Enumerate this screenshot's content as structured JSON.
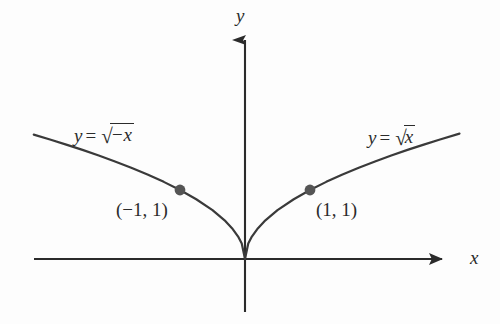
{
  "figure": {
    "background_color": "#fdfdfd",
    "curve_color": "#3a3a3a",
    "axis_color": "#2b2b2b",
    "point_color": "#555555",
    "text_color": "#2b2b2b"
  },
  "axes": {
    "x_label": "x",
    "y_label": "y",
    "origin_px": {
      "x": 245,
      "y": 259
    },
    "x_axis_left_px": 34,
    "x_axis_right_px": 448,
    "y_axis_top_px": 32,
    "y_axis_bottom_px": 312,
    "x_arrowhead": "right",
    "y_arrowhead": "up",
    "ticks_shown": false,
    "gridlines": false
  },
  "curves": {
    "right": {
      "label_lhs": "y",
      "label_op": "=",
      "radical_sign": "√",
      "radicand": "x",
      "label_plain": "y = √x",
      "label_pos_px": {
        "x": 368,
        "y": 126
      }
    },
    "left": {
      "label_lhs": "y",
      "label_op": "=",
      "radical_sign": "√",
      "radicand": "−x",
      "label_plain": "y = √−x",
      "label_pos_px": {
        "x": 74,
        "y": 124
      }
    }
  },
  "points": [
    {
      "label": "(−1, 1)",
      "x": -1,
      "y": 1,
      "dot_px": {
        "x": 180,
        "y": 192
      },
      "label_px": {
        "x": 116,
        "y": 200
      }
    },
    {
      "label": "(1, 1)",
      "x": 1,
      "y": 1,
      "dot_px": {
        "x": 310,
        "y": 190
      },
      "label_px": {
        "x": 316,
        "y": 200
      }
    }
  ],
  "chart_data": {
    "type": "line",
    "title": "",
    "xlabel": "x",
    "ylabel": "y",
    "xlim": [
      -3.25,
      3.1
    ],
    "ylim": [
      -0.8,
      3.3
    ],
    "grid": false,
    "legend": "inline-curve-labels",
    "annotations": [
      {
        "text": "y = √x",
        "x": 1.9,
        "y": 1.95
      },
      {
        "text": "y = √−x",
        "x": -2.6,
        "y": 2.0
      },
      {
        "text": "(−1, 1)",
        "x": -1.95,
        "y": 0.85
      },
      {
        "text": "(1, 1)",
        "x": 1.1,
        "y": 0.85
      }
    ],
    "series": [
      {
        "name": "y = √x",
        "domain": [
          0,
          3.3
        ],
        "x": [
          0,
          0.05,
          0.1,
          0.2,
          0.3,
          0.5,
          0.75,
          1,
          1.25,
          1.5,
          1.75,
          2,
          2.25,
          2.5,
          2.75,
          3,
          3.3
        ],
        "values": [
          0,
          0.2236,
          0.3162,
          0.4472,
          0.5477,
          0.7071,
          0.866,
          1,
          1.118,
          1.2247,
          1.3229,
          1.4142,
          1.5,
          1.5811,
          1.6583,
          1.7321,
          1.8166
        ]
      },
      {
        "name": "y = √−x",
        "domain": [
          -3.25,
          0
        ],
        "x": [
          -3.25,
          -3,
          -2.75,
          -2.5,
          -2.25,
          -2,
          -1.75,
          -1.5,
          -1.25,
          -1,
          -0.75,
          -0.5,
          -0.3,
          -0.2,
          -0.1,
          -0.05,
          0
        ],
        "values": [
          1.8028,
          1.7321,
          1.6583,
          1.5811,
          1.5,
          1.4142,
          1.3229,
          1.2247,
          1.118,
          1,
          0.866,
          0.7071,
          0.5477,
          0.4472,
          0.3162,
          0.2236,
          0
        ]
      }
    ],
    "markers": [
      {
        "x": -1,
        "y": 1,
        "label": "(−1, 1)"
      },
      {
        "x": 1,
        "y": 1,
        "label": "(1, 1)"
      }
    ]
  }
}
